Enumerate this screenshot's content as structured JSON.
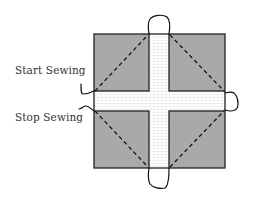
{
  "diagram": {
    "type": "quilt-block-sewing-instructions",
    "labels": {
      "start": "Start Sewing",
      "stop": "Stop Sewing"
    },
    "colors": {
      "background": "#ffffff",
      "fabric_square": "#a9a9a9",
      "sashing": "#ffffff",
      "sashing_texture": "#dcdcdc",
      "outline": "#222222",
      "stitch_line": "#111111",
      "thread": "#111111",
      "label_text": "#333333"
    },
    "elements": {
      "block": {
        "x": 94,
        "y": 34,
        "width": 131,
        "height": 134
      },
      "vertical_sashing": {
        "x": 149,
        "width": 20
      },
      "horizontal_sashing": {
        "y": 91,
        "height": 20
      },
      "corner_squares": [
        "top-left",
        "top-right",
        "bottom-left",
        "bottom-right"
      ],
      "stitch_lines": "dashed diagonals forming a diamond across the four corner squares",
      "thread_loops": [
        "top",
        "right",
        "bottom",
        "left-start",
        "left-stop"
      ]
    }
  }
}
